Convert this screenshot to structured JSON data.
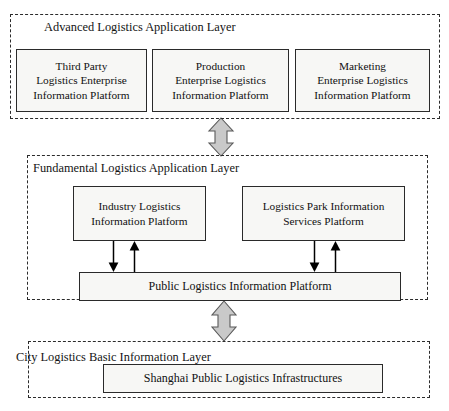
{
  "diagram": {
    "layers": [
      {
        "id": "advanced",
        "label": "Advanced Logistics Application Layer",
        "boxes": [
          {
            "id": "third-party",
            "label": "Third Party\nLogistics Enterprise\nInformation Platform",
            "lines": [
              "Third Party",
              "Logistics Enterprise",
              "Information Platform"
            ]
          },
          {
            "id": "production",
            "label": "Production\nEnterprise Logistics\nInformation Platform",
            "lines": [
              "Production",
              "Enterprise Logistics",
              "Information Platform"
            ]
          },
          {
            "id": "marketing",
            "label": "Marketing\nEnterprise Logistics\nInformation Platform",
            "lines": [
              "Marketing",
              "Enterprise Logistics",
              "Information Platform"
            ]
          }
        ]
      },
      {
        "id": "fundamental",
        "label": "Fundamental Logistics Application Layer",
        "boxes": [
          {
            "id": "industry",
            "label": "Industry Logistics\nInformation Platform",
            "lines": [
              "Industry Logistics",
              "Information Platform"
            ]
          },
          {
            "id": "park",
            "label": "Logistics Park Information\nServices Platform",
            "lines": [
              "Logistics Park Information",
              "Services Platform"
            ]
          },
          {
            "id": "public",
            "label": "Public Logistics Information Platform",
            "lines": [
              "Public Logistics Information Platform"
            ]
          }
        ]
      },
      {
        "id": "city",
        "label": "City Logistics Basic Information Layer",
        "boxes": [
          {
            "id": "shanghai",
            "label": "Shanghai Public Logistics Infrastructures",
            "lines": [
              "Shanghai Public Logistics Infrastructures"
            ]
          }
        ]
      }
    ],
    "connectors": [
      {
        "id": "advanced-to-fundamental",
        "type": "double-arrow-vertical",
        "style": "block-gray"
      },
      {
        "id": "fundamental-to-city",
        "type": "double-arrow-vertical",
        "style": "block-gray"
      },
      {
        "id": "industry-down",
        "type": "arrow-down",
        "style": "thin-black"
      },
      {
        "id": "industry-up",
        "type": "arrow-up",
        "style": "thin-black"
      },
      {
        "id": "park-down",
        "type": "arrow-down",
        "style": "thin-black"
      },
      {
        "id": "park-up",
        "type": "arrow-up",
        "style": "thin-black"
      }
    ],
    "colors": {
      "box_fill": "#f7f7f5",
      "box_stroke": "#2a2a2a",
      "layer_stroke": "#2b2b2b",
      "connector_gray_fill": "#c9c9c9",
      "connector_gray_stroke": "#555555",
      "connector_black": "#000000",
      "text": "#111111",
      "background": "#ffffff"
    }
  }
}
